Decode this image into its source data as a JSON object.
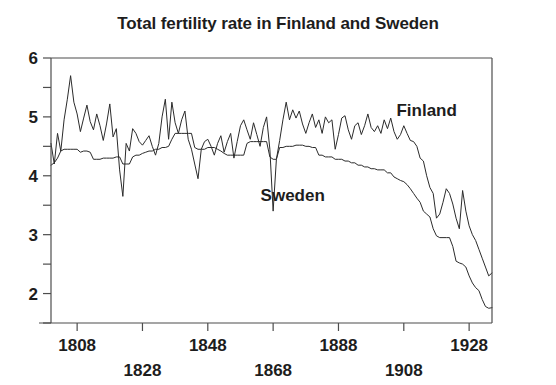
{
  "chart_data": {
    "type": "line",
    "title": "Total fertility rate in Finland and Sweden",
    "xlabel": "Year",
    "ylabel": "",
    "xlim": [
      1800,
      1935
    ],
    "ylim": [
      1.5,
      6
    ],
    "grid": false,
    "legend_position": "inline-annotation",
    "y_ticks": [
      2,
      2.5,
      3,
      3.5,
      4,
      4.5,
      5,
      5.5,
      6
    ],
    "y_tick_labels": [
      "2",
      "",
      "3",
      "",
      "4",
      "",
      "5",
      "",
      "6"
    ],
    "x_ticks": [
      1808,
      1828,
      1848,
      1868,
      1888,
      1908,
      1928
    ],
    "x_tick_labels": [
      "1808",
      "1828",
      "1848",
      "1868",
      "1888",
      "1908",
      "1928"
    ],
    "x_tick_label_rows": [
      0,
      1,
      0,
      1,
      0,
      1,
      0
    ],
    "annotations": [
      {
        "text": "Finland",
        "x": 1915,
        "y": 5.02
      },
      {
        "text": "Sweden",
        "x": 1874,
        "y": 3.57
      }
    ],
    "series": [
      {
        "name": "Finland",
        "x": [
          1800,
          1801,
          1802,
          1803,
          1804,
          1805,
          1806,
          1807,
          1808,
          1809,
          1810,
          1811,
          1812,
          1813,
          1814,
          1815,
          1816,
          1817,
          1818,
          1819,
          1820,
          1821,
          1822,
          1823,
          1824,
          1825,
          1826,
          1827,
          1828,
          1829,
          1830,
          1831,
          1832,
          1833,
          1834,
          1835,
          1836,
          1837,
          1838,
          1839,
          1840,
          1841,
          1842,
          1843,
          1844,
          1845,
          1846,
          1847,
          1848,
          1849,
          1850,
          1851,
          1852,
          1853,
          1854,
          1855,
          1856,
          1857,
          1858,
          1859,
          1860,
          1861,
          1862,
          1863,
          1864,
          1865,
          1866,
          1867,
          1868,
          1869,
          1870,
          1871,
          1872,
          1873,
          1874,
          1875,
          1876,
          1877,
          1878,
          1879,
          1880,
          1881,
          1882,
          1883,
          1884,
          1885,
          1886,
          1887,
          1888,
          1889,
          1890,
          1891,
          1892,
          1893,
          1894,
          1895,
          1896,
          1897,
          1898,
          1899,
          1900,
          1901,
          1902,
          1903,
          1904,
          1905,
          1906,
          1907,
          1908,
          1909,
          1910,
          1911,
          1912,
          1913,
          1914,
          1915,
          1916,
          1917,
          1918,
          1919,
          1920,
          1921,
          1922,
          1923,
          1924,
          1925,
          1926,
          1927,
          1928,
          1929,
          1930,
          1931,
          1932,
          1933,
          1934,
          1935
        ],
        "values": [
          4.55,
          4.2,
          4.72,
          4.42,
          4.95,
          5.3,
          5.7,
          5.25,
          5.05,
          4.75,
          4.98,
          5.2,
          4.92,
          4.78,
          5.05,
          4.85,
          4.6,
          4.88,
          5.22,
          4.66,
          4.8,
          4.1,
          3.65,
          4.55,
          4.42,
          4.8,
          4.72,
          4.58,
          4.52,
          4.6,
          4.68,
          4.5,
          4.35,
          4.55,
          5.0,
          5.3,
          4.62,
          5.25,
          4.9,
          4.72,
          4.95,
          5.1,
          4.62,
          4.45,
          4.2,
          3.95,
          4.45,
          4.58,
          4.62,
          4.5,
          4.35,
          4.55,
          4.68,
          4.4,
          4.58,
          4.72,
          4.3,
          4.58,
          4.85,
          4.95,
          4.78,
          4.62,
          4.9,
          4.7,
          4.5,
          4.82,
          5.0,
          4.45,
          3.4,
          4.28,
          4.6,
          4.95,
          5.25,
          4.95,
          5.12,
          4.98,
          5.1,
          4.88,
          4.72,
          4.9,
          5.05,
          4.82,
          4.95,
          4.72,
          5.0,
          4.9,
          4.95,
          4.45,
          4.7,
          4.98,
          5.02,
          4.78,
          4.62,
          4.85,
          4.9,
          4.7,
          4.85,
          5.05,
          4.82,
          4.75,
          4.85,
          4.72,
          4.95,
          4.8,
          4.98,
          4.75,
          4.62,
          4.7,
          4.85,
          4.72,
          4.6,
          4.58,
          4.5,
          4.3,
          4.25,
          4.0,
          3.8,
          3.7,
          3.28,
          3.35,
          3.55,
          3.78,
          3.7,
          3.52,
          3.28,
          3.1,
          3.75,
          3.4,
          3.15,
          3.0,
          2.9,
          2.75,
          2.6,
          2.45,
          2.3,
          2.35
        ]
      },
      {
        "name": "Sweden",
        "x": [
          1800,
          1801,
          1802,
          1803,
          1804,
          1805,
          1806,
          1807,
          1808,
          1809,
          1810,
          1811,
          1812,
          1813,
          1814,
          1815,
          1816,
          1817,
          1818,
          1819,
          1820,
          1821,
          1822,
          1823,
          1824,
          1825,
          1826,
          1827,
          1828,
          1829,
          1830,
          1831,
          1832,
          1833,
          1834,
          1835,
          1836,
          1837,
          1838,
          1839,
          1840,
          1841,
          1842,
          1843,
          1844,
          1845,
          1846,
          1847,
          1848,
          1849,
          1850,
          1851,
          1852,
          1853,
          1854,
          1855,
          1856,
          1857,
          1858,
          1859,
          1860,
          1861,
          1862,
          1863,
          1864,
          1865,
          1866,
          1867,
          1868,
          1869,
          1870,
          1871,
          1872,
          1873,
          1874,
          1875,
          1876,
          1877,
          1878,
          1879,
          1880,
          1881,
          1882,
          1883,
          1884,
          1885,
          1886,
          1887,
          1888,
          1889,
          1890,
          1891,
          1892,
          1893,
          1894,
          1895,
          1896,
          1897,
          1898,
          1899,
          1900,
          1901,
          1902,
          1903,
          1904,
          1905,
          1906,
          1907,
          1908,
          1909,
          1910,
          1911,
          1912,
          1913,
          1914,
          1915,
          1916,
          1917,
          1918,
          1919,
          1920,
          1921,
          1922,
          1923,
          1924,
          1925,
          1926,
          1927,
          1928,
          1929,
          1930,
          1931,
          1932,
          1933,
          1934,
          1935
        ],
        "values": [
          4.18,
          4.22,
          4.3,
          4.42,
          4.45,
          4.45,
          4.45,
          4.45,
          4.45,
          4.4,
          4.42,
          4.42,
          4.4,
          4.28,
          4.28,
          4.28,
          4.3,
          4.3,
          4.3,
          4.3,
          4.32,
          4.32,
          4.2,
          4.2,
          4.2,
          4.32,
          4.35,
          4.35,
          4.38,
          4.4,
          4.42,
          4.42,
          4.45,
          4.45,
          4.48,
          4.48,
          4.5,
          4.62,
          4.72,
          4.72,
          4.72,
          4.72,
          4.72,
          4.72,
          4.48,
          4.45,
          4.45,
          4.45,
          4.48,
          4.48,
          4.48,
          4.45,
          4.42,
          4.38,
          4.35,
          4.35,
          4.35,
          4.35,
          4.35,
          4.35,
          4.55,
          4.58,
          4.58,
          4.58,
          4.58,
          4.58,
          4.58,
          4.32,
          4.28,
          4.28,
          4.48,
          4.48,
          4.5,
          4.5,
          4.5,
          4.52,
          4.52,
          4.52,
          4.5,
          4.5,
          4.48,
          4.48,
          4.35,
          4.35,
          4.32,
          4.32,
          4.32,
          4.28,
          4.28,
          4.28,
          4.25,
          4.25,
          4.22,
          4.22,
          4.18,
          4.18,
          4.15,
          4.15,
          4.12,
          4.12,
          4.1,
          4.1,
          4.1,
          4.05,
          4.05,
          3.98,
          3.95,
          3.92,
          3.9,
          3.85,
          3.78,
          3.7,
          3.62,
          3.55,
          3.4,
          3.35,
          3.3,
          3.1,
          2.98,
          2.95,
          2.95,
          2.95,
          2.95,
          2.8,
          2.55,
          2.52,
          2.5,
          2.45,
          2.3,
          2.18,
          2.1,
          2.05,
          1.9,
          1.78,
          1.75,
          1.76
        ]
      }
    ]
  },
  "geometry": {
    "plot_left": 51,
    "plot_right": 492,
    "plot_top": 58,
    "plot_bottom": 323
  }
}
